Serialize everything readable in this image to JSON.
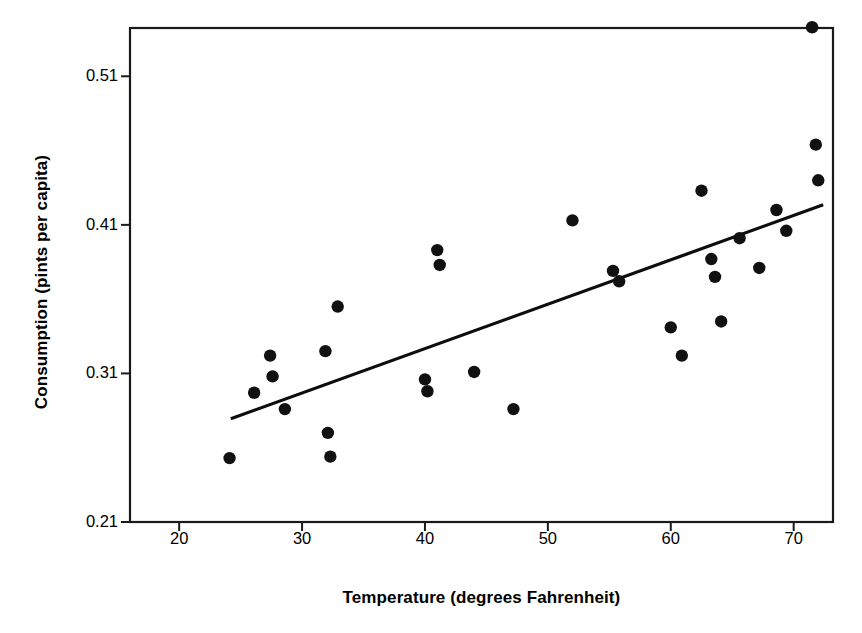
{
  "chart_data": {
    "type": "scatter",
    "title": "",
    "xlabel": "Temperature (degrees Fahrenheit)",
    "ylabel": "Consumption (pints per capita)",
    "xlim": [
      16,
      73.2
    ],
    "ylim": [
      0.21,
      0.5425
    ],
    "grid": false,
    "legend": null,
    "xticks": [
      20,
      30,
      40,
      50,
      60,
      70
    ],
    "xtick_labels": [
      "20",
      "30",
      "40",
      "50",
      "60",
      "70"
    ],
    "yticks": [
      0.21,
      0.31,
      0.41,
      0.51
    ],
    "ytick_labels": [
      "0.21",
      "0.31",
      "0.41",
      "0.51"
    ],
    "marker": "filled-circle",
    "marker_color": "#111111",
    "x": [
      24.1,
      26.1,
      27.4,
      27.6,
      28.6,
      31.9,
      32.1,
      32.3,
      32.9,
      40.0,
      40.2,
      41.0,
      41.2,
      44.0,
      47.2,
      52.0,
      55.3,
      55.8,
      60.0,
      60.9,
      62.5,
      63.3,
      63.6,
      64.1,
      65.6,
      67.2,
      68.6,
      69.4,
      71.5,
      71.8,
      72.0
    ],
    "y": [
      0.253,
      0.297,
      0.322,
      0.308,
      0.286,
      0.325,
      0.27,
      0.254,
      0.355,
      0.306,
      0.298,
      0.393,
      0.383,
      0.311,
      0.286,
      0.413,
      0.379,
      0.372,
      0.341,
      0.322,
      0.433,
      0.387,
      0.375,
      0.345,
      0.401,
      0.381,
      0.42,
      0.406,
      0.543,
      0.464,
      0.44
    ],
    "points": [
      {
        "x": 24.1,
        "y": 0.253
      },
      {
        "x": 26.1,
        "y": 0.297
      },
      {
        "x": 27.4,
        "y": 0.322
      },
      {
        "x": 27.6,
        "y": 0.308
      },
      {
        "x": 28.6,
        "y": 0.286
      },
      {
        "x": 31.9,
        "y": 0.325
      },
      {
        "x": 32.1,
        "y": 0.27
      },
      {
        "x": 32.3,
        "y": 0.254
      },
      {
        "x": 32.9,
        "y": 0.355
      },
      {
        "x": 40.0,
        "y": 0.306
      },
      {
        "x": 40.2,
        "y": 0.298
      },
      {
        "x": 41.0,
        "y": 0.393
      },
      {
        "x": 41.2,
        "y": 0.383
      },
      {
        "x": 44.0,
        "y": 0.311
      },
      {
        "x": 47.2,
        "y": 0.286
      },
      {
        "x": 52.0,
        "y": 0.413
      },
      {
        "x": 55.3,
        "y": 0.379
      },
      {
        "x": 55.8,
        "y": 0.372
      },
      {
        "x": 60.0,
        "y": 0.341
      },
      {
        "x": 60.9,
        "y": 0.322
      },
      {
        "x": 62.5,
        "y": 0.433
      },
      {
        "x": 63.3,
        "y": 0.387
      },
      {
        "x": 63.6,
        "y": 0.375
      },
      {
        "x": 64.1,
        "y": 0.345
      },
      {
        "x": 65.6,
        "y": 0.401
      },
      {
        "x": 67.2,
        "y": 0.381
      },
      {
        "x": 68.6,
        "y": 0.42
      },
      {
        "x": 69.4,
        "y": 0.406
      },
      {
        "x": 71.5,
        "y": 0.543
      },
      {
        "x": 71.8,
        "y": 0.464
      },
      {
        "x": 72.0,
        "y": 0.44
      }
    ],
    "trendline": {
      "type": "linear-fit",
      "x_start": 24.2,
      "y_start": 0.2795,
      "x_end": 72.4,
      "y_end": 0.4235,
      "color": "#0d0d0d"
    }
  }
}
